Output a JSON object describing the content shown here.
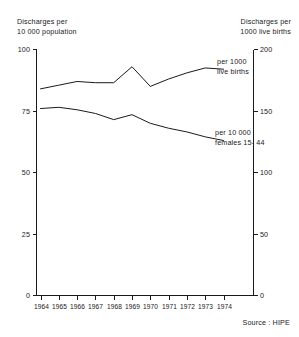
{
  "axes": {
    "left_caption": "Discharges per\n10 000  population",
    "right_caption": "Discharges per\n1000 live births",
    "left_ticks": [
      "0",
      "25",
      "50",
      "75",
      "100"
    ],
    "right_ticks": [
      "0",
      "50",
      "100",
      "150",
      "200"
    ]
  },
  "labels": {
    "series_1": "per 1000\nlive births",
    "series_2": "per 10 000\nfemales 15- 44"
  },
  "source": "Source : HIPE",
  "chart_data": {
    "type": "line",
    "title": "",
    "subtitle": "",
    "xlabel": "",
    "ylabel": "Discharges per 10 000  population",
    "y2label": "Discharges per 1000 live births",
    "grid": false,
    "legend": "inline-right",
    "categories": [
      "1964",
      "1965",
      "1966",
      "1967",
      "1968",
      "1969",
      "1970",
      "1971",
      "1972",
      "1973",
      "1974"
    ],
    "x": [
      1964,
      1965,
      1966,
      1967,
      1968,
      1969,
      1970,
      1971,
      1972,
      1973,
      1974
    ],
    "ylim": [
      0,
      100
    ],
    "y2lim": [
      0,
      200
    ],
    "yticks": [
      0,
      25,
      50,
      75,
      100
    ],
    "y2ticks": [
      0,
      50,
      100,
      150,
      200
    ],
    "series": [
      {
        "name": "per 1000 live births",
        "axis": "right",
        "units": "discharges per 1000 live births",
        "values": [
          168,
          171,
          174,
          173,
          173,
          186,
          170,
          176,
          181,
          185,
          184
        ],
        "values_left_scale": [
          84.0,
          85.5,
          87.0,
          86.5,
          86.5,
          93.0,
          85.0,
          88.0,
          90.5,
          92.5,
          92.0
        ]
      },
      {
        "name": "per 10 000 females 15- 44",
        "axis": "left",
        "units": "discharges per 10 000 females aged 15-44",
        "values": [
          76.0,
          76.5,
          75.5,
          74.0,
          71.5,
          73.5,
          70.0,
          68.0,
          66.5,
          64.5,
          63.0
        ]
      }
    ]
  }
}
